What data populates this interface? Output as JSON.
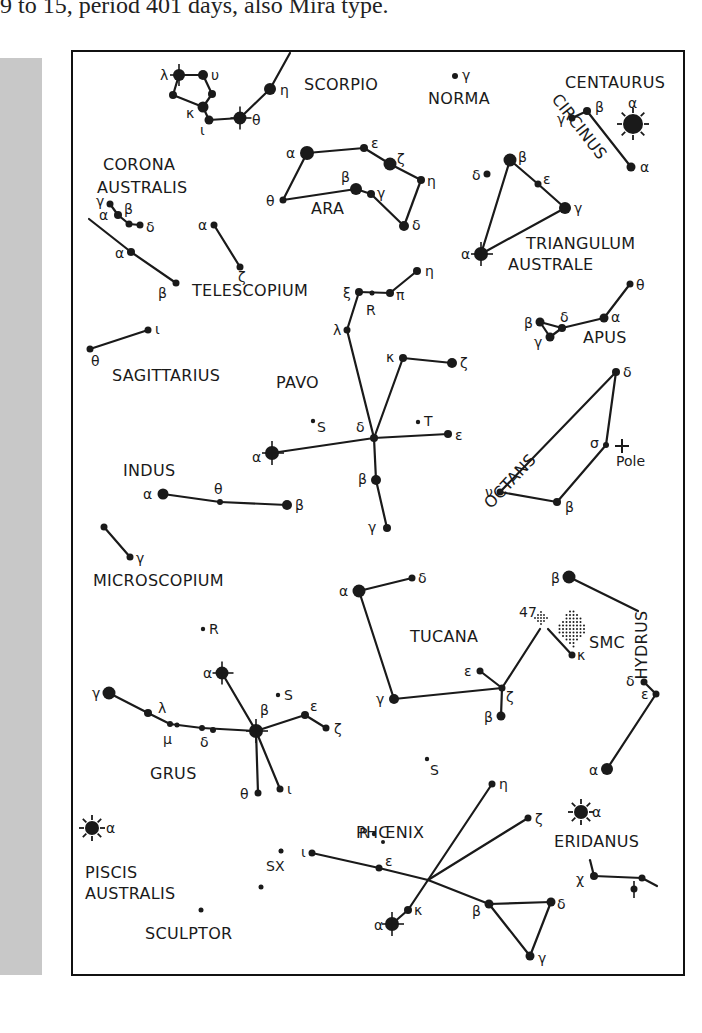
{
  "caption": "9 to 15, period 401 days, also Mira type.",
  "colors": {
    "ink": "#1a1a1a",
    "band": "#c8c8c8",
    "background": "#ffffff"
  },
  "constellations": [
    {
      "name": "SCORPIO",
      "x": 304,
      "y": 90
    },
    {
      "name": "NORMA",
      "x": 428,
      "y": 104
    },
    {
      "name": "CENTAURUS",
      "x": 565,
      "y": 88
    },
    {
      "name": "CORONA",
      "x": 103,
      "y": 170
    },
    {
      "name": "AUSTRALIS",
      "x": 97,
      "y": 193
    },
    {
      "name": "ARA",
      "x": 311,
      "y": 214
    },
    {
      "name": "TRIANGULUM",
      "x": 526,
      "y": 249
    },
    {
      "name": "AUSTRALE",
      "x": 508,
      "y": 270
    },
    {
      "name": "TELESCOPIUM",
      "x": 192,
      "y": 296
    },
    {
      "name": "APUS",
      "x": 583,
      "y": 343
    },
    {
      "name": "SAGITTARIUS",
      "x": 112,
      "y": 381
    },
    {
      "name": "PAVO",
      "x": 276,
      "y": 388
    },
    {
      "name": "INDUS",
      "x": 123,
      "y": 476
    },
    {
      "name": "MICROSCOPIUM",
      "x": 93,
      "y": 586
    },
    {
      "name": "TUCANA",
      "x": 410,
      "y": 642
    },
    {
      "name": "SMC",
      "x": 589,
      "y": 648
    },
    {
      "name": "GRUS",
      "x": 150,
      "y": 779
    },
    {
      "name": "PHŒNIX",
      "x": 356,
      "y": 838
    },
    {
      "name": "ERIDANUS",
      "x": 554,
      "y": 847
    },
    {
      "name": "PISCIS",
      "x": 85,
      "y": 878
    },
    {
      "name": "AUSTRALIS",
      "x": 85,
      "y": 899
    },
    {
      "name": "SCULPTOR",
      "x": 145,
      "y": 939
    }
  ],
  "rotated_labels": [
    {
      "name": "CIRCINUS",
      "x": 575,
      "y": 130,
      "angle": 52
    },
    {
      "name": "OCTANS",
      "x": 514,
      "y": 485,
      "angle": -47
    },
    {
      "name": "HYDRUS",
      "x": 647,
      "y": 645,
      "angle": -90
    }
  ],
  "stars": [
    {
      "g": "λ",
      "x": 179,
      "y": 75,
      "r": 6,
      "mark": "cross",
      "lx": 160,
      "ly": 80
    },
    {
      "g": "υ",
      "x": 203,
      "y": 75,
      "r": 5,
      "lx": 211,
      "ly": 80
    },
    {
      "g": "",
      "x": 173,
      "y": 95,
      "r": 4
    },
    {
      "g": "",
      "x": 212,
      "y": 94,
      "r": 4
    },
    {
      "g": "κ",
      "x": 203,
      "y": 107,
      "r": 5.5,
      "lx": 186,
      "ly": 118
    },
    {
      "g": "ι",
      "x": 209,
      "y": 120,
      "r": 4.5,
      "lx": 200,
      "ly": 135
    },
    {
      "g": "θ",
      "x": 240,
      "y": 118,
      "r": 6.5,
      "mark": "cross",
      "lx": 252,
      "ly": 125
    },
    {
      "g": "η",
      "x": 270,
      "y": 89,
      "r": 6,
      "lx": 280,
      "ly": 95
    },
    {
      "g": "γ",
      "x": 455,
      "y": 76,
      "r": 3,
      "lx": 462,
      "ly": 80
    },
    {
      "g": "α",
      "x": 633,
      "y": 124,
      "r": 10,
      "mark": "sun",
      "lx": 628,
      "ly": 108
    },
    {
      "g": "γ",
      "x": 572,
      "y": 118,
      "r": 3.5,
      "lx": 557,
      "ly": 124
    },
    {
      "g": "β",
      "x": 587,
      "y": 111,
      "r": 4,
      "lx": 595,
      "ly": 112
    },
    {
      "g": "α",
      "x": 631,
      "y": 167,
      "r": 4.5,
      "lx": 640,
      "ly": 172
    },
    {
      "g": "α",
      "x": 307,
      "y": 153,
      "r": 7,
      "lx": 286,
      "ly": 158
    },
    {
      "g": "ε",
      "x": 364,
      "y": 148,
      "r": 4,
      "lx": 371,
      "ly": 148
    },
    {
      "g": "ζ",
      "x": 390,
      "y": 164,
      "r": 6.5,
      "lx": 397,
      "ly": 164
    },
    {
      "g": "η",
      "x": 421,
      "y": 180,
      "r": 4,
      "lx": 427,
      "ly": 186
    },
    {
      "g": "δ",
      "x": 404,
      "y": 226,
      "r": 5,
      "lx": 412,
      "ly": 230
    },
    {
      "g": "β",
      "x": 356,
      "y": 189,
      "r": 6,
      "lx": 341,
      "ly": 182
    },
    {
      "g": "γ",
      "x": 371,
      "y": 194,
      "r": 4,
      "lx": 377,
      "ly": 198
    },
    {
      "g": "θ",
      "x": 283,
      "y": 200,
      "r": 3.5,
      "lx": 266,
      "ly": 206
    },
    {
      "g": "β",
      "x": 510,
      "y": 160,
      "r": 6.5,
      "lx": 518,
      "ly": 162
    },
    {
      "g": "δ",
      "x": 487,
      "y": 174,
      "r": 3.5,
      "lx": 472,
      "ly": 180
    },
    {
      "g": "ε",
      "x": 538,
      "y": 184,
      "r": 3.5,
      "lx": 543,
      "ly": 184
    },
    {
      "g": "γ",
      "x": 565,
      "y": 208,
      "r": 6,
      "lx": 574,
      "ly": 213
    },
    {
      "g": "α",
      "x": 481,
      "y": 254,
      "r": 7,
      "mark": "cross",
      "lx": 461,
      "ly": 259
    },
    {
      "g": "γ",
      "x": 110,
      "y": 204,
      "r": 3.5,
      "lx": 96,
      "ly": 206
    },
    {
      "g": "α",
      "x": 118,
      "y": 215,
      "r": 4,
      "lx": 99,
      "ly": 220
    },
    {
      "g": "β",
      "x": 129,
      "y": 224,
      "r": 3.5,
      "lx": 124,
      "ly": 214
    },
    {
      "g": "δ",
      "x": 140,
      "y": 225,
      "r": 3.5,
      "lx": 146,
      "ly": 232
    },
    {
      "g": "α",
      "x": 131,
      "y": 252,
      "r": 4,
      "lx": 115,
      "ly": 258
    },
    {
      "g": "β",
      "x": 176,
      "y": 283,
      "r": 3.5,
      "lx": 158,
      "ly": 298
    },
    {
      "g": "α",
      "x": 214,
      "y": 225,
      "r": 3.5,
      "lx": 198,
      "ly": 230
    },
    {
      "g": "ζ",
      "x": 240,
      "y": 267,
      "r": 3.5,
      "lx": 238,
      "ly": 282
    },
    {
      "g": "ξ",
      "x": 359,
      "y": 292,
      "r": 4,
      "lx": 343,
      "ly": 298
    },
    {
      "g": "",
      "x": 372,
      "y": 293,
      "r": 2.5
    },
    {
      "g": "π",
      "x": 390,
      "y": 293,
      "r": 4,
      "lx": 396,
      "ly": 300
    },
    {
      "g": "η",
      "x": 417,
      "y": 271,
      "r": 4,
      "lx": 425,
      "ly": 276
    },
    {
      "g": "λ",
      "x": 347,
      "y": 330,
      "r": 3.5,
      "lx": 333,
      "ly": 335
    },
    {
      "g": "κ",
      "x": 403,
      "y": 358,
      "r": 4,
      "lx": 386,
      "ly": 362
    },
    {
      "g": "ζ",
      "x": 452,
      "y": 363,
      "r": 5,
      "lx": 460,
      "ly": 368
    },
    {
      "g": "δ",
      "x": 374,
      "y": 438,
      "r": 4,
      "lx": 356,
      "ly": 432
    },
    {
      "g": "ε",
      "x": 448,
      "y": 434,
      "r": 4,
      "lx": 455,
      "ly": 440
    },
    {
      "g": "α",
      "x": 272,
      "y": 453,
      "r": 7,
      "mark": "cross",
      "lx": 252,
      "ly": 462
    },
    {
      "g": "β",
      "x": 376,
      "y": 480,
      "r": 5,
      "lx": 358,
      "ly": 484
    },
    {
      "g": "γ",
      "x": 387,
      "y": 528,
      "r": 4,
      "lx": 368,
      "ly": 532
    },
    {
      "g": "θ",
      "x": 630,
      "y": 284,
      "r": 3.5,
      "lx": 636,
      "ly": 290
    },
    {
      "g": "α",
      "x": 604,
      "y": 318,
      "r": 4.5,
      "lx": 611,
      "ly": 322
    },
    {
      "g": "δ",
      "x": 562,
      "y": 328,
      "r": 4,
      "lx": 560,
      "ly": 322
    },
    {
      "g": "β",
      "x": 540,
      "y": 322,
      "r": 4.5,
      "lx": 524,
      "ly": 328
    },
    {
      "g": "γ",
      "x": 550,
      "y": 337,
      "r": 4.5,
      "lx": 534,
      "ly": 347
    },
    {
      "g": "δ",
      "x": 616,
      "y": 372,
      "r": 4,
      "lx": 623,
      "ly": 377
    },
    {
      "g": "σ",
      "x": 606,
      "y": 445,
      "r": 3,
      "lx": 590,
      "ly": 448
    },
    {
      "g": "β",
      "x": 557,
      "y": 502,
      "r": 4,
      "lx": 565,
      "ly": 512
    },
    {
      "g": "ν",
      "x": 500,
      "y": 492,
      "r": 3.5,
      "lx": 485,
      "ly": 497
    },
    {
      "g": "θ",
      "x": 90,
      "y": 349,
      "r": 3.5,
      "lx": 91,
      "ly": 366
    },
    {
      "g": "ι",
      "x": 148,
      "y": 330,
      "r": 3.5,
      "lx": 155,
      "ly": 334
    },
    {
      "g": "α",
      "x": 163,
      "y": 494,
      "r": 5.5,
      "lx": 143,
      "ly": 499
    },
    {
      "g": "θ",
      "x": 220,
      "y": 502,
      "r": 3,
      "lx": 214,
      "ly": 494
    },
    {
      "g": "β",
      "x": 287,
      "y": 505,
      "r": 5,
      "lx": 295,
      "ly": 510
    },
    {
      "g": "",
      "x": 104,
      "y": 527,
      "r": 3.5
    },
    {
      "g": "γ",
      "x": 130,
      "y": 557,
      "r": 3.5,
      "lx": 136,
      "ly": 563
    },
    {
      "g": "α",
      "x": 359,
      "y": 591,
      "r": 6.5,
      "lx": 339,
      "ly": 596
    },
    {
      "g": "δ",
      "x": 412,
      "y": 578,
      "r": 3.5,
      "lx": 418,
      "ly": 583
    },
    {
      "g": "γ",
      "x": 394,
      "y": 699,
      "r": 5,
      "lx": 376,
      "ly": 704
    },
    {
      "g": "ε",
      "x": 480,
      "y": 671,
      "r": 3.5,
      "lx": 464,
      "ly": 676
    },
    {
      "g": "ζ",
      "x": 502,
      "y": 688,
      "r": 3.5,
      "lx": 506,
      "ly": 702
    },
    {
      "g": "β",
      "x": 501,
      "y": 716,
      "r": 4.5,
      "lx": 484,
      "ly": 722
    },
    {
      "g": "κ",
      "x": 572,
      "y": 655,
      "r": 3.5,
      "lx": 577,
      "ly": 660
    },
    {
      "g": "β",
      "x": 569,
      "y": 577,
      "r": 6.5,
      "lx": 551,
      "ly": 583
    },
    {
      "g": "δ",
      "x": 644,
      "y": 682,
      "r": 3.5,
      "lx": 626,
      "ly": 686
    },
    {
      "g": "ε",
      "x": 656,
      "y": 694,
      "r": 3.5,
      "lx": 641,
      "ly": 699
    },
    {
      "g": "α",
      "x": 607,
      "y": 769,
      "r": 6,
      "lx": 589,
      "ly": 775
    },
    {
      "g": "γ",
      "x": 109,
      "y": 693,
      "r": 6.5,
      "lx": 92,
      "ly": 698
    },
    {
      "g": "λ",
      "x": 148,
      "y": 713,
      "r": 4,
      "lx": 158,
      "ly": 713
    },
    {
      "g": "μ",
      "x": 170,
      "y": 724,
      "r": 3,
      "lx": 163,
      "ly": 744
    },
    {
      "g": "",
      "x": 177,
      "y": 725,
      "r": 2.5
    },
    {
      "g": "δ",
      "x": 202,
      "y": 728,
      "r": 3,
      "lx": 200,
      "ly": 747
    },
    {
      "g": "",
      "x": 213,
      "y": 730,
      "r": 3
    },
    {
      "g": "β",
      "x": 256,
      "y": 731,
      "r": 7,
      "mark": "cross",
      "lx": 260,
      "ly": 715
    },
    {
      "g": "α",
      "x": 222,
      "y": 673,
      "r": 6.5,
      "mark": "cross",
      "lx": 203,
      "ly": 678
    },
    {
      "g": "ε",
      "x": 305,
      "y": 715,
      "r": 4,
      "lx": 310,
      "ly": 711
    },
    {
      "g": "ζ",
      "x": 326,
      "y": 728,
      "r": 3.5,
      "lx": 334,
      "ly": 734
    },
    {
      "g": "θ",
      "x": 258,
      "y": 793,
      "r": 3.5,
      "lx": 240,
      "ly": 799
    },
    {
      "g": "ι",
      "x": 280,
      "y": 789,
      "r": 3.5,
      "lx": 287,
      "ly": 794
    },
    {
      "g": "α",
      "x": 92,
      "y": 828,
      "r": 7,
      "mark": "sun",
      "lx": 106,
      "ly": 833
    },
    {
      "g": "",
      "x": 201,
      "y": 910,
      "r": 2.5
    },
    {
      "g": "",
      "x": 261,
      "y": 887,
      "r": 2.5
    },
    {
      "g": "",
      "x": 281,
      "y": 851,
      "r": 2.5
    },
    {
      "g": "ι",
      "x": 312,
      "y": 853,
      "r": 3.5,
      "lx": 301,
      "ly": 857
    },
    {
      "g": "ε",
      "x": 379,
      "y": 868,
      "r": 3.5,
      "lx": 385,
      "ly": 866
    },
    {
      "g": "",
      "x": 383,
      "y": 842,
      "r": 2
    },
    {
      "g": "η",
      "x": 492,
      "y": 784,
      "r": 3.5,
      "lx": 499,
      "ly": 789
    },
    {
      "g": "ζ",
      "x": 528,
      "y": 818,
      "r": 3.5,
      "lx": 535,
      "ly": 824
    },
    {
      "g": "κ",
      "x": 408,
      "y": 910,
      "r": 4,
      "lx": 414,
      "ly": 915
    },
    {
      "g": "α",
      "x": 392,
      "y": 924,
      "r": 7,
      "mark": "cross",
      "lx": 374,
      "ly": 930
    },
    {
      "g": "β",
      "x": 489,
      "y": 904,
      "r": 4.5,
      "lx": 472,
      "ly": 916
    },
    {
      "g": "δ",
      "x": 551,
      "y": 902,
      "r": 4.5,
      "lx": 557,
      "ly": 909
    },
    {
      "g": "γ",
      "x": 530,
      "y": 956,
      "r": 4.5,
      "lx": 538,
      "ly": 963
    },
    {
      "g": "α",
      "x": 581,
      "y": 812,
      "r": 7,
      "mark": "sun",
      "lx": 592,
      "ly": 817
    },
    {
      "g": "χ",
      "x": 594,
      "y": 876,
      "r": 4,
      "lx": 576,
      "ly": 884
    },
    {
      "g": "",
      "x": 642,
      "y": 878,
      "r": 3.5
    },
    {
      "g": "φ",
      "x": 634,
      "y": 889,
      "r": 3.5,
      "mark": "vbar"
    }
  ],
  "variables": [
    {
      "label": "R",
      "x": 372,
      "y": 293,
      "lx": 366,
      "ly": 315
    },
    {
      "label": "S",
      "x": 313,
      "y": 421,
      "lx": 317,
      "ly": 432
    },
    {
      "label": "T",
      "x": 418,
      "y": 422,
      "lx": 424,
      "ly": 426
    },
    {
      "label": "R",
      "x": 203,
      "y": 629,
      "lx": 209,
      "ly": 634
    },
    {
      "label": "S",
      "x": 278,
      "y": 695,
      "lx": 284,
      "ly": 700
    },
    {
      "label": "S",
      "x": 427,
      "y": 759,
      "lx": 430,
      "ly": 775
    },
    {
      "label": "R",
      "x": 374,
      "y": 834,
      "lx": 359,
      "ly": 838
    },
    {
      "label": "SX",
      "x": 281,
      "y": 851,
      "lx": 266,
      "ly": 871
    }
  ],
  "special": {
    "cluster_47": {
      "label": "47",
      "x": 541,
      "y": 618,
      "lx": 519,
      "ly": 617
    },
    "smc": {
      "x": 572,
      "y": 628
    },
    "pole": {
      "label": "Pole",
      "x": 622,
      "y": 446,
      "lx": 616,
      "ly": 466,
      "symbol": "+"
    }
  },
  "lines": [
    [
      179,
      75,
      203,
      75
    ],
    [
      203,
      75,
      212,
      94
    ],
    [
      212,
      94,
      203,
      107
    ],
    [
      179,
      75,
      173,
      95
    ],
    [
      173,
      95,
      203,
      107
    ],
    [
      203,
      107,
      209,
      120
    ],
    [
      209,
      120,
      240,
      118
    ],
    [
      240,
      118,
      270,
      89
    ],
    [
      270,
      89,
      290,
      53
    ],
    [
      572,
      118,
      587,
      111
    ],
    [
      587,
      111,
      631,
      167
    ],
    [
      307,
      153,
      364,
      148
    ],
    [
      364,
      148,
      390,
      164
    ],
    [
      390,
      164,
      421,
      180
    ],
    [
      421,
      180,
      404,
      226
    ],
    [
      404,
      226,
      371,
      194
    ],
    [
      371,
      194,
      356,
      189
    ],
    [
      356,
      189,
      283,
      200
    ],
    [
      283,
      200,
      307,
      153
    ],
    [
      510,
      160,
      538,
      184
    ],
    [
      538,
      184,
      565,
      208
    ],
    [
      565,
      208,
      481,
      254
    ],
    [
      481,
      254,
      510,
      160
    ],
    [
      110,
      204,
      118,
      215
    ],
    [
      118,
      215,
      129,
      224
    ],
    [
      129,
      224,
      140,
      225
    ],
    [
      89,
      219,
      131,
      252
    ],
    [
      131,
      252,
      176,
      283
    ],
    [
      214,
      225,
      240,
      267
    ],
    [
      359,
      292,
      390,
      293
    ],
    [
      390,
      293,
      417,
      271
    ],
    [
      359,
      292,
      347,
      330
    ],
    [
      347,
      330,
      374,
      438
    ],
    [
      374,
      438,
      403,
      358
    ],
    [
      403,
      358,
      452,
      363
    ],
    [
      374,
      438,
      448,
      434
    ],
    [
      374,
      438,
      272,
      453
    ],
    [
      374,
      438,
      376,
      480
    ],
    [
      376,
      480,
      387,
      528
    ],
    [
      630,
      284,
      604,
      318
    ],
    [
      604,
      318,
      562,
      328
    ],
    [
      562,
      328,
      540,
      322
    ],
    [
      540,
      322,
      550,
      337
    ],
    [
      550,
      337,
      562,
      328
    ],
    [
      616,
      372,
      606,
      445
    ],
    [
      606,
      445,
      557,
      502
    ],
    [
      557,
      502,
      500,
      492
    ],
    [
      500,
      492,
      616,
      372
    ],
    [
      90,
      349,
      148,
      330
    ],
    [
      163,
      494,
      220,
      502
    ],
    [
      220,
      502,
      287,
      505
    ],
    [
      104,
      527,
      130,
      557
    ],
    [
      359,
      591,
      412,
      578
    ],
    [
      359,
      591,
      394,
      699
    ],
    [
      394,
      699,
      502,
      688
    ],
    [
      480,
      671,
      502,
      688
    ],
    [
      502,
      688,
      501,
      716
    ],
    [
      502,
      688,
      540,
      629
    ],
    [
      548,
      629,
      572,
      655
    ],
    [
      569,
      577,
      638,
      611
    ],
    [
      656,
      694,
      607,
      769
    ],
    [
      644,
      682,
      656,
      694
    ],
    [
      109,
      693,
      148,
      713
    ],
    [
      148,
      713,
      170,
      724
    ],
    [
      170,
      724,
      202,
      728
    ],
    [
      202,
      728,
      256,
      731
    ],
    [
      222,
      673,
      256,
      731
    ],
    [
      256,
      731,
      305,
      715
    ],
    [
      305,
      715,
      326,
      728
    ],
    [
      256,
      731,
      258,
      793
    ],
    [
      256,
      731,
      280,
      789
    ],
    [
      312,
      853,
      379,
      868
    ],
    [
      379,
      868,
      428,
      880
    ],
    [
      428,
      880,
      492,
      784
    ],
    [
      428,
      880,
      528,
      818
    ],
    [
      428,
      880,
      408,
      910
    ],
    [
      408,
      910,
      392,
      924
    ],
    [
      428,
      880,
      489,
      904
    ],
    [
      489,
      904,
      551,
      902
    ],
    [
      551,
      902,
      530,
      956
    ],
    [
      530,
      956,
      489,
      904
    ],
    [
      594,
      876,
      642,
      878
    ],
    [
      642,
      878,
      657,
      886
    ],
    [
      594,
      876,
      590,
      860
    ]
  ]
}
